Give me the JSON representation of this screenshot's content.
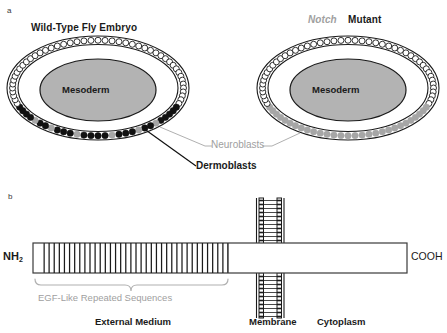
{
  "figure": {
    "panels": [
      {
        "letter": "a",
        "id": "embryo-panel"
      },
      {
        "letter": "b",
        "id": "protein-panel"
      }
    ]
  },
  "panel_a": {
    "left_embryo": {
      "title_plain": "Wild-Type Fly Embryo",
      "title_italic_gene": "",
      "core_label": "Mesoderm",
      "ventral_cells": [
        "black",
        "black",
        "black",
        "black",
        "black",
        "gray",
        "black",
        "black",
        "gray",
        "black",
        "black",
        "black",
        "gray",
        "black",
        "black",
        "black",
        "gray",
        "black",
        "black",
        "black",
        "gray",
        "black",
        "black",
        "gray",
        "black",
        "black",
        "black",
        "black"
      ],
      "dorsal_cell_style": "open"
    },
    "right_embryo": {
      "title_italic_gene": "Notch",
      "title_plain": "Mutant",
      "core_label": "Mesoderm",
      "ventral_cells": [
        "gray",
        "gray",
        "gray",
        "gray",
        "gray",
        "gray",
        "gray",
        "gray",
        "gray",
        "gray",
        "gray",
        "gray",
        "gray",
        "gray",
        "gray",
        "gray",
        "gray",
        "gray",
        "gray",
        "gray",
        "gray",
        "gray",
        "gray",
        "gray",
        "gray",
        "gray",
        "gray",
        "gray"
      ],
      "dorsal_cell_style": "open"
    },
    "callouts": [
      {
        "label": "Neuroblasts",
        "color": "#a0a0a0",
        "style": "gray"
      },
      {
        "label": "Dermoblasts",
        "color": "#111111",
        "style": "bold-black"
      }
    ]
  },
  "panel_b": {
    "n_terminus": "NH",
    "n_terminus_sub": "2",
    "c_terminus": "COOH",
    "bracket_label": "EGF-Like Repeated Sequences",
    "repeat_count": 36,
    "regions": [
      {
        "label": "External Medium"
      },
      {
        "label": "Membrane"
      },
      {
        "label": "Cytoplasm"
      }
    ]
  },
  "colors": {
    "neuroblast_gray": "#a6a6a6",
    "dermoblast_black": "#111111",
    "mesoderm_fill": "#b3b3b3",
    "outline": "#1a1a1a",
    "label_gray": "#a0a0a0",
    "background": "#ffffff"
  }
}
